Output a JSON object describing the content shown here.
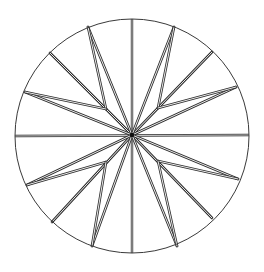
{
  "figure": {
    "background": "#ffffff",
    "line_color": "#2e2e2e",
    "circle": {
      "cx": 132,
      "cy": 136,
      "r": 117
    },
    "center": {
      "x": 132,
      "y": 135
    },
    "axis_lines": [
      {
        "name": "vertical",
        "x1": 132,
        "y1": 19,
        "x2": 132,
        "y2": 253
      },
      {
        "name": "horizontal",
        "x1": 15,
        "y1": 136,
        "x2": 249,
        "y2": 135
      }
    ],
    "diagonal_rays": [
      {
        "name": "upper-left",
        "x2": 50,
        "y2": 53
      },
      {
        "name": "upper-right",
        "x2": 212,
        "y2": 52
      },
      {
        "name": "lower-left",
        "x2": 52,
        "y2": 222
      },
      {
        "name": "lower-right",
        "x2": 212,
        "y2": 218
      }
    ],
    "inner_vertices": [
      {
        "name": "upper-left",
        "x": 106,
        "y": 109
      },
      {
        "name": "upper-right",
        "x": 158,
        "y": 108
      },
      {
        "name": "lower-left",
        "x": 106,
        "y": 162
      },
      {
        "name": "lower-right",
        "x": 158,
        "y": 161
      }
    ],
    "star_points": [
      {
        "name": "top-left",
        "x": 88,
        "y": 27,
        "inner": 0
      },
      {
        "name": "left-upper",
        "x": 25,
        "y": 92,
        "inner": 0
      },
      {
        "name": "top-right",
        "x": 174,
        "y": 27,
        "inner": 1
      },
      {
        "name": "right-upper",
        "x": 236,
        "y": 87,
        "inner": 1
      },
      {
        "name": "left-lower",
        "x": 27,
        "y": 185,
        "inner": 2
      },
      {
        "name": "bottom-left",
        "x": 92,
        "y": 246,
        "inner": 2
      },
      {
        "name": "right-lower",
        "x": 238,
        "y": 179,
        "inner": 3
      },
      {
        "name": "bottom-right",
        "x": 177,
        "y": 246,
        "inner": 3
      }
    ]
  }
}
